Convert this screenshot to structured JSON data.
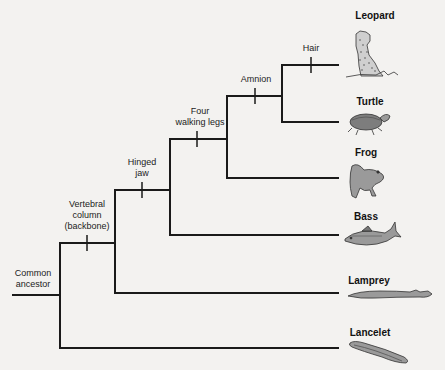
{
  "diagram": {
    "type": "cladogram",
    "root": {
      "label_line1": "Common",
      "label_line2": "ancestor"
    },
    "traits": [
      {
        "id": "vertebral",
        "lines": [
          "Vertebral",
          "column",
          "(backbone)"
        ]
      },
      {
        "id": "hinged",
        "lines": [
          "Hinged",
          "jaw"
        ]
      },
      {
        "id": "legs",
        "lines": [
          "Four",
          "walking legs"
        ]
      },
      {
        "id": "amnion",
        "lines": [
          "Amnion"
        ]
      },
      {
        "id": "hair",
        "lines": [
          "Hair"
        ]
      }
    ],
    "taxa": [
      {
        "name": "Leopard",
        "icon": "leopard-icon"
      },
      {
        "name": "Turtle",
        "icon": "turtle-icon"
      },
      {
        "name": "Frog",
        "icon": "frog-icon"
      },
      {
        "name": "Bass",
        "icon": "bass-fish-icon"
      },
      {
        "name": "Lamprey",
        "icon": "lamprey-icon"
      },
      {
        "name": "Lancelet",
        "icon": "lancelet-icon"
      }
    ],
    "colors": {
      "line": "#1a1a1a",
      "animal_fill": "#9a9a9a",
      "animal_stroke": "#333333",
      "background": "#f3f2f0"
    }
  }
}
